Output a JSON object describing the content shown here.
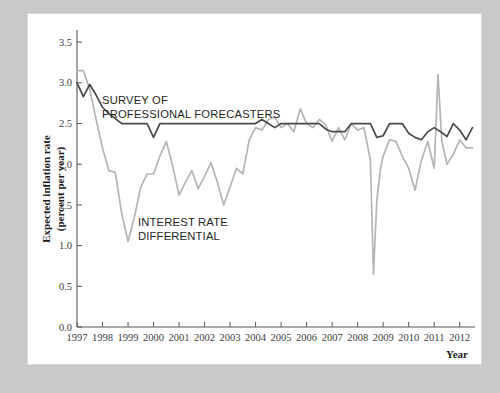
{
  "figure": {
    "background_color": "#c9c9c9",
    "card_color": "#ffffff",
    "ylabel_line1": "Expected inflation rate",
    "ylabel_line2": "(percent per year)",
    "xlabel": "Year"
  },
  "annotations": {
    "survey_line1": "SURVEY OF",
    "survey_line2": "PROFESSIONAL FORECASTERS",
    "differential_line1": "INTEREST RATE",
    "differential_line2": "DIFFERENTIAL"
  },
  "chart_data": {
    "type": "line",
    "title": "",
    "xlabel": "Year",
    "ylabel": "Expected inflation rate (percent per year)",
    "xlim": [
      1997,
      2012.6
    ],
    "ylim": [
      0.0,
      3.6
    ],
    "yticks": [
      0.0,
      0.5,
      1.0,
      1.5,
      2.0,
      2.5,
      3.0,
      3.5
    ],
    "ytick_labels": [
      "0.0",
      "0.5",
      "1.0",
      "1.5",
      "2.0",
      "2.5",
      "3.0",
      "3.5"
    ],
    "xticks": [
      1997,
      1998,
      1999,
      2000,
      2001,
      2002,
      2003,
      2004,
      2005,
      2006,
      2007,
      2008,
      2009,
      2010,
      2011,
      2012
    ],
    "xtick_labels": [
      "1997",
      "1998",
      "1999",
      "2000",
      "2001",
      "2002",
      "2003",
      "2004",
      "2005",
      "2006",
      "2007",
      "2008",
      "2009",
      "2010",
      "2011",
      "2012"
    ],
    "grid": false,
    "legend_position": "inline-annotation",
    "series": [
      {
        "name": "SURVEY OF PROFESSIONAL FORECASTERS",
        "color": "#4a4a4c",
        "x": [
          1997.0,
          1997.25,
          1997.5,
          1997.75,
          1998.0,
          1998.25,
          1998.5,
          1998.75,
          1999.0,
          1999.25,
          1999.5,
          1999.75,
          2000.0,
          2000.25,
          2000.5,
          2000.75,
          2001.0,
          2001.25,
          2001.5,
          2001.75,
          2002.0,
          2002.25,
          2002.5,
          2002.75,
          2003.0,
          2003.25,
          2003.5,
          2003.75,
          2004.0,
          2004.25,
          2004.5,
          2004.75,
          2005.0,
          2005.25,
          2005.5,
          2005.75,
          2006.0,
          2006.25,
          2006.5,
          2006.75,
          2007.0,
          2007.25,
          2007.5,
          2007.75,
          2008.0,
          2008.25,
          2008.5,
          2008.75,
          2009.0,
          2009.25,
          2009.5,
          2009.75,
          2010.0,
          2010.25,
          2010.5,
          2010.75,
          2011.0,
          2011.25,
          2011.5,
          2011.75,
          2012.0,
          2012.25,
          2012.5
        ],
        "values": [
          3.0,
          2.83,
          2.98,
          2.85,
          2.7,
          2.62,
          2.56,
          2.5,
          2.5,
          2.5,
          2.5,
          2.5,
          2.33,
          2.5,
          2.5,
          2.5,
          2.5,
          2.5,
          2.5,
          2.5,
          2.5,
          2.5,
          2.5,
          2.5,
          2.5,
          2.5,
          2.5,
          2.5,
          2.5,
          2.55,
          2.5,
          2.45,
          2.5,
          2.5,
          2.5,
          2.5,
          2.5,
          2.5,
          2.5,
          2.43,
          2.4,
          2.4,
          2.4,
          2.5,
          2.5,
          2.5,
          2.5,
          2.33,
          2.35,
          2.5,
          2.5,
          2.5,
          2.38,
          2.33,
          2.3,
          2.4,
          2.45,
          2.4,
          2.34,
          2.5,
          2.42,
          2.3,
          2.45
        ]
      },
      {
        "name": "INTEREST RATE DIFFERENTIAL",
        "color": "#b5b5b7",
        "x": [
          1997.0,
          1997.25,
          1997.5,
          1997.75,
          1998.0,
          1998.25,
          1998.5,
          1998.75,
          1999.0,
          1999.25,
          1999.5,
          1999.75,
          2000.0,
          2000.25,
          2000.5,
          2000.75,
          2001.0,
          2001.25,
          2001.5,
          2001.75,
          2002.0,
          2002.25,
          2002.5,
          2002.75,
          2003.0,
          2003.25,
          2003.5,
          2003.75,
          2004.0,
          2004.25,
          2004.5,
          2004.75,
          2005.0,
          2005.25,
          2005.5,
          2005.75,
          2006.0,
          2006.25,
          2006.5,
          2006.75,
          2007.0,
          2007.25,
          2007.5,
          2007.75,
          2008.0,
          2008.25,
          2008.5,
          2008.62,
          2008.75,
          2008.9,
          2009.0,
          2009.25,
          2009.5,
          2009.75,
          2010.0,
          2010.25,
          2010.5,
          2010.75,
          2011.0,
          2011.15,
          2011.3,
          2011.5,
          2011.75,
          2012.0,
          2012.25,
          2012.5
        ],
        "values": [
          3.15,
          3.15,
          2.92,
          2.55,
          2.2,
          1.92,
          1.9,
          1.4,
          1.05,
          1.35,
          1.72,
          1.88,
          1.88,
          2.1,
          2.28,
          1.98,
          1.62,
          1.78,
          1.92,
          1.7,
          1.85,
          2.02,
          1.78,
          1.5,
          1.72,
          1.95,
          1.88,
          2.3,
          2.45,
          2.42,
          2.55,
          2.58,
          2.45,
          2.5,
          2.4,
          2.68,
          2.5,
          2.45,
          2.55,
          2.48,
          2.28,
          2.45,
          2.3,
          2.5,
          2.42,
          2.45,
          2.05,
          0.65,
          1.55,
          1.95,
          2.1,
          2.3,
          2.28,
          2.1,
          1.95,
          1.68,
          2.05,
          2.28,
          1.95,
          3.1,
          2.28,
          2.0,
          2.12,
          2.3,
          2.2,
          2.2
        ]
      }
    ]
  }
}
